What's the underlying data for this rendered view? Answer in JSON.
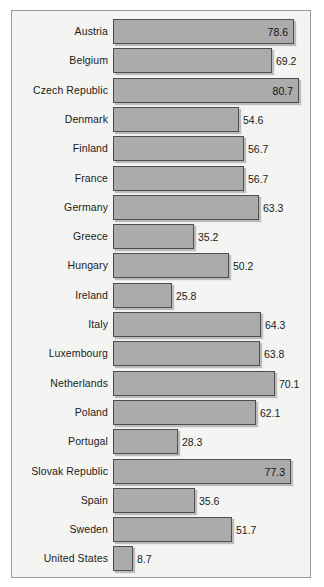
{
  "figure": {
    "frame": {
      "border_color": "#9a9a9a",
      "panel_color": "#f4f4f2"
    },
    "bar_fill": "#ababab",
    "bar_border": "#4e4e4e",
    "text_color": "#1b1b1b"
  },
  "chart_data": {
    "type": "bar",
    "orientation": "horizontal",
    "title": "",
    "subtitle": "",
    "xlabel": "",
    "ylabel": "",
    "grid": false,
    "legend": null,
    "xlim": [
      0,
      80.7
    ],
    "value_label_format": "one-decimal",
    "categories": [
      "Austria",
      "Belgium",
      "Czech Republic",
      "Denmark",
      "Finland",
      "France",
      "Germany",
      "Greece",
      "Hungary",
      "Ireland",
      "Italy",
      "Luxembourg",
      "Netherlands",
      "Poland",
      "Portugal",
      "Slovak Republic",
      "Spain",
      "Sweden",
      "United States"
    ],
    "values": [
      78.6,
      69.2,
      80.7,
      54.6,
      56.7,
      56.7,
      63.3,
      35.2,
      50.2,
      25.8,
      64.3,
      63.8,
      70.1,
      62.1,
      28.3,
      77.3,
      35.6,
      51.7,
      8.7
    ],
    "value_labels": [
      "78.6",
      "69.2",
      "80.7",
      "54.6",
      "56.7",
      "56.7",
      "63.3",
      "35.2",
      "50.2",
      "25.8",
      "64.3",
      "63.8",
      "70.1",
      "62.1",
      "28.3",
      "77.3",
      "35.6",
      "51.7",
      "8.7"
    ],
    "label_placement": [
      "inside",
      "outside",
      "inside",
      "outside",
      "outside",
      "outside",
      "outside",
      "outside",
      "outside",
      "outside",
      "outside",
      "outside",
      "outside",
      "outside",
      "outside",
      "inside",
      "outside",
      "outside",
      "outside"
    ]
  }
}
